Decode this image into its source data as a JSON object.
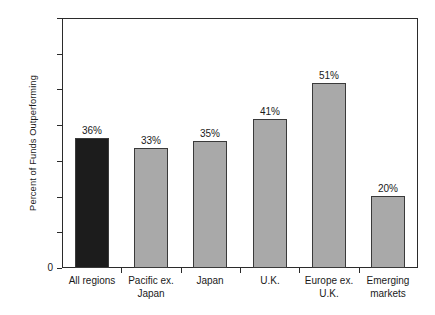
{
  "chart_data": {
    "type": "bar",
    "title": "",
    "subtitle": "",
    "xlabel": "",
    "ylabel": "Percent of Funds Outperforming",
    "categories": [
      "All regions",
      "Pacific ex.\nJapan",
      "Japan",
      "U.K.",
      "Europe ex.\nU.K.",
      "Emerging\nmarkets"
    ],
    "values": [
      36,
      33,
      35,
      41,
      51,
      20
    ],
    "value_labels": [
      "36%",
      "33%",
      "35%",
      "41%",
      "51%",
      "20%"
    ],
    "ylim": [
      0,
      69
    ],
    "y_tick_labels": [
      "0"
    ],
    "y_tick_count": 8,
    "grid": false,
    "legend": "none",
    "bar_colors": [
      "#1c1c1c",
      "#a9a9a9",
      "#a9a9a9",
      "#a9a9a9",
      "#a9a9a9",
      "#a9a9a9"
    ],
    "bar_border_color": "#3a3a3a",
    "axis_color": "#2b2b2b",
    "background_color": "#ffffff",
    "text_color": "#1a1a1a"
  }
}
